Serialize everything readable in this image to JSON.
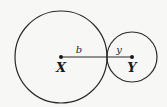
{
  "figure": {
    "width": 167,
    "height": 107,
    "background": "#f7f7f5",
    "stroke_color": "#2a2a2a"
  },
  "circles": [
    {
      "name": "circle-x",
      "cx": 61,
      "cy": 57,
      "r": 46
    },
    {
      "name": "circle-y",
      "cx": 132,
      "cy": 57,
      "r": 25
    }
  ],
  "points": [
    {
      "label": "X",
      "x": 61,
      "y": 57,
      "label_x": 61,
      "label_y": 72
    },
    {
      "label": "Y",
      "x": 132,
      "y": 57,
      "label_x": 132,
      "label_y": 72
    }
  ],
  "segment": {
    "x1": 61,
    "y1": 57,
    "x2": 132,
    "y2": 57
  },
  "segment_labels": [
    {
      "text": "b",
      "x": 79,
      "y": 53
    },
    {
      "text": "y",
      "x": 119,
      "y": 53
    }
  ]
}
